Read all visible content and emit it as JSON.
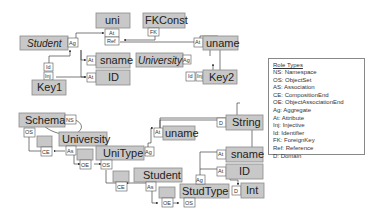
{
  "diagram": {
    "objects": {
      "uni": "uni",
      "fkconst": "FKConst",
      "student_top": "Student",
      "sname_top": "sname",
      "id_top": "ID",
      "key1": "Key1",
      "university_top": "University",
      "uname_top": "uname",
      "key2": "Key2",
      "schema": "Schema",
      "university": "University",
      "unitype": "UniType",
      "student": "Student",
      "studtype": "StudType",
      "string": "String",
      "uname": "uname",
      "sname": "sname",
      "id": "ID",
      "int": "Int"
    },
    "roles": {
      "at": "At",
      "ag": "Ag",
      "ref": "Ref",
      "fk": "FK",
      "id": "Id",
      "inj": "Inj",
      "ns": "NS",
      "os": "OS",
      "ce": "CE",
      "as": "As",
      "oe": "OE",
      "d": "D"
    }
  },
  "legend": {
    "title": "Role Types",
    "items": [
      "NS: Namespace",
      "OS: ObjectSet",
      "AS: Association",
      "CE: CompositionEnd",
      "OE: ObjectAssociationEnd",
      "Ag: Aggregate",
      "At: Attribute",
      "Inj: Injective",
      "Id: Identifier",
      "FK: ForeignKey",
      "Ref: Reference",
      "D: Domain"
    ]
  }
}
